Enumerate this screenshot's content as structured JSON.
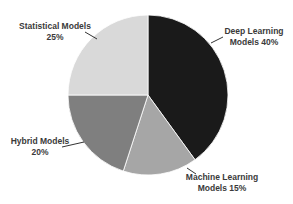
{
  "chart_data": {
    "type": "pie",
    "title": "",
    "start_angle_deg": 0,
    "direction": "clockwise",
    "categories": [
      "Deep Learning Models",
      "Machine Learning Models",
      "Hybrid Models",
      "Statistical Models"
    ],
    "values": [
      40,
      15,
      20,
      25
    ],
    "unit": "%",
    "colors": [
      "#1a1a1a",
      "#a6a6a6",
      "#7f7f7f",
      "#d9d9d9"
    ],
    "legend": "none",
    "data_labels": [
      {
        "line1": "Deep Learning",
        "line2": "Models 40%",
        "x": 254,
        "y": 26,
        "leader": [
          223,
          37,
          211,
          43
        ]
      },
      {
        "line1": "Machine Learning",
        "line2": "Models 15%",
        "x": 222,
        "y": 172,
        "leader": [
          196,
          174,
          187,
          168
        ]
      },
      {
        "line1": "Hybrid Models",
        "line2": "20%",
        "x": 40,
        "y": 136,
        "leader": [
          62,
          147,
          84,
          142
        ]
      },
      {
        "line1": "Statistical Models",
        "line2": "25%",
        "x": 55,
        "y": 21,
        "leader": [
          85,
          32,
          97,
          39
        ]
      }
    ],
    "geometry": {
      "cx": 148,
      "cy": 95,
      "r": 80,
      "separator_color": "#ffffff"
    }
  }
}
